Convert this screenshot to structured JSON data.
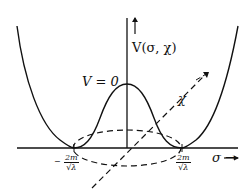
{
  "diagram": {
    "y_axis_label": "V(σ, χ)",
    "x_axis_label": "σ →",
    "depth_axis_label": "χ",
    "peak_label": "V = 0",
    "left_min_label": {
      "sign": "−",
      "num": "2m",
      "den": "√λ"
    },
    "right_min_label": {
      "num": "2m",
      "den": "√λ"
    },
    "colors": {
      "stroke": "#111111",
      "background": "#ffffff"
    }
  }
}
